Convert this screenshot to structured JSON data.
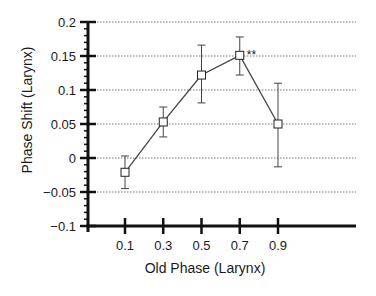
{
  "chart_data": {
    "type": "line",
    "title": "",
    "xlabel": "Old Phase (Larynx)",
    "ylabel": "Phase Shift (Larynx)",
    "categories": [
      "0.1",
      "0.3",
      "0.5",
      "0.7",
      "0.9"
    ],
    "x": [
      0.1,
      0.3,
      0.5,
      0.7,
      0.9
    ],
    "series": [
      {
        "name": "Phase Shift",
        "marker": "open-square",
        "values": [
          -0.021,
          0.053,
          0.122,
          0.151,
          0.05
        ],
        "error_upper": [
          0.003,
          0.075,
          0.166,
          0.178,
          0.11
        ],
        "error_lower": [
          -0.045,
          0.031,
          0.081,
          0.122,
          -0.013
        ]
      }
    ],
    "annotations": [
      {
        "x": 0.7,
        "text": "**"
      }
    ],
    "ylim": [
      -0.1,
      0.2
    ],
    "yticks": [
      0.2,
      0.15,
      0.1,
      0.05,
      0,
      -0.05,
      -0.1
    ],
    "ytick_labels": [
      "0.2",
      "0.15",
      "0.1",
      "0.05",
      "0",
      "−0.05",
      "−0.1"
    ],
    "grid": "horizontal dotted",
    "legend": "none"
  },
  "colors": {
    "axis": "#111111",
    "line": "#444444",
    "grid": "#777777",
    "marker_fill": "#ffffff"
  }
}
